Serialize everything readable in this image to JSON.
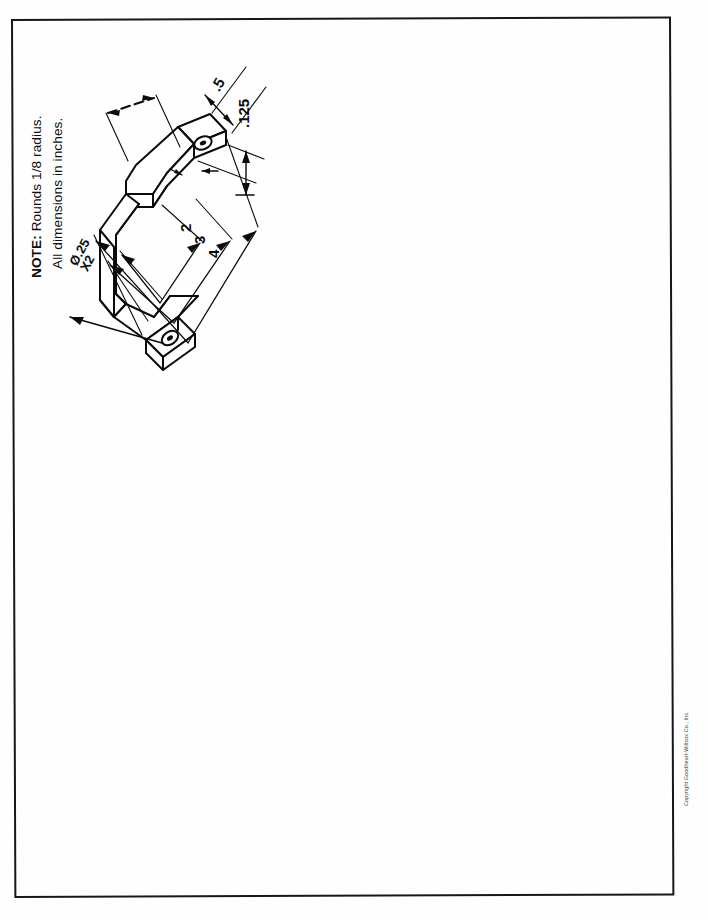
{
  "page": {
    "background_color": "#fefefe",
    "border_color": "#171717",
    "ink_color": "#0b0b0b"
  },
  "note": {
    "prefix": "NOTE:",
    "line1_rest": " Rounds 1/8 radius.",
    "line2": "All dimensions in inches."
  },
  "drawing": {
    "title": "isometric-bracket",
    "description": "Isometric pictorial of a formed U-shaped sheet-metal bracket with two flat mounting tabs, each containing a through hole.",
    "dimensions": [
      {
        "name": "thickness",
        "label": ".125"
      },
      {
        "name": "tab-width",
        "label": ".5"
      },
      {
        "name": "inner-depth",
        "label": "2"
      },
      {
        "name": "mid-depth",
        "label": "3"
      },
      {
        "name": "overall-length",
        "label": "4"
      }
    ],
    "callouts": [
      {
        "name": "hole-diameter",
        "line1": "Ø.25",
        "line2": "X2"
      }
    ],
    "unlabeled_dimension": {
      "name": "top-flange-dimension",
      "label": ""
    }
  },
  "copyright": {
    "text": "Copyright Goodheart-Willcox Co., Inc."
  }
}
